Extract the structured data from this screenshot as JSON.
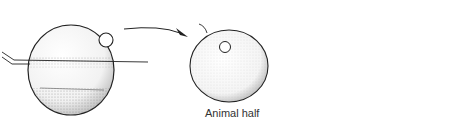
{
  "diagram": {
    "type": "embryology-sequence",
    "stages": [
      {
        "id": "whole-egg",
        "description": "Egg bisected along equator by a fine thread/needle, with nucleus in upper (animal) hemisphere and stippled lower (vegetal) region"
      },
      {
        "id": "animal-half",
        "label": "Animal half",
        "description": "Isolated upper half rounds up into a sphere containing the nucleus"
      },
      {
        "id": "ciliated-blastula",
        "description": "Develops into a hollow ciliated ball of cells (blastula-like) with radiating cilia"
      }
    ],
    "arrows": [
      {
        "from": "whole-egg",
        "to": "animal-half"
      },
      {
        "from": "animal-half",
        "to": "ciliated-blastula"
      }
    ]
  },
  "labels": {
    "animal_half": "Animal half"
  },
  "colors": {
    "ink": "#222222",
    "stipple": "#9a9a9a",
    "background": "#ffffff"
  }
}
